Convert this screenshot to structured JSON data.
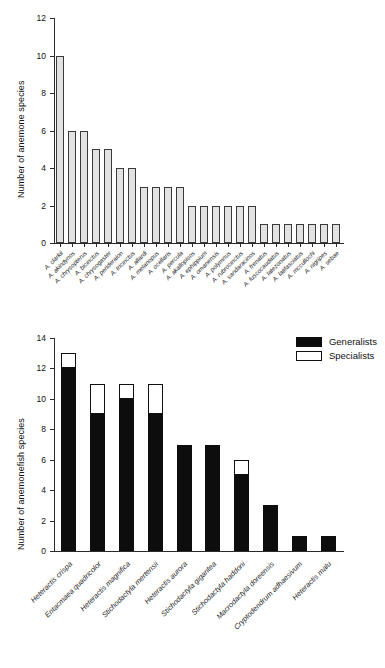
{
  "figure": {
    "panels": [
      "top",
      "bottom"
    ]
  },
  "legend": {
    "entries": [
      {
        "label": "Generalists",
        "swatch": "filled-black-rect",
        "color": "#0d0d0d"
      },
      {
        "label": "Specialists",
        "swatch": "hollow-white-rect",
        "color": "#ffffff"
      }
    ]
  },
  "chart_data": [
    {
      "type": "bar",
      "panel": "top",
      "title": "",
      "xlabel": "",
      "ylabel": "Number of anemone species",
      "ylim": [
        0,
        12
      ],
      "yticks": [
        0,
        2,
        4,
        6,
        8,
        10,
        12
      ],
      "grid": false,
      "legend_position": "none",
      "bar_style": {
        "fill": "#e2e2e2",
        "stroke": "#3a3a3a"
      },
      "categories": [
        "A. clarkii",
        "A. akindynos",
        "A. chrysopterus",
        "A. bicinctus",
        "A. chrysogaster",
        "A. perideraion",
        "A. tricinctus",
        "A. allardi",
        "A. melanopus",
        "A. ocellaris",
        "A. percula",
        "A. akallopisos",
        "A. ephippium",
        "A. omanensis",
        "A. polymnus",
        "A. rubrocinctus",
        "A. sandaracinos",
        "A. frenatus",
        "A. fuscocaudatus",
        "A. latezonatus",
        "A. latifasciatus",
        "A. mccullochi",
        "A. nigripes",
        "A. sebae"
      ],
      "values": [
        10,
        6,
        6,
        5,
        5,
        4,
        4,
        3,
        3,
        3,
        3,
        2,
        2,
        2,
        2,
        2,
        2,
        1,
        1,
        1,
        1,
        1,
        1,
        1
      ]
    },
    {
      "type": "bar",
      "panel": "bottom",
      "stacked": true,
      "title": "",
      "xlabel": "",
      "ylabel": "Number of anemonefish species",
      "ylim": [
        0,
        14
      ],
      "yticks": [
        0,
        2,
        4,
        6,
        8,
        10,
        12,
        14
      ],
      "grid": false,
      "legend_position": "top-right",
      "categories": [
        "Heteractis crispa",
        "Entacmaea quadricolor",
        "Heteractis magnifica",
        "Stichodactyla mertensii",
        "Heteractis aurora",
        "Stichodactyla gigantea",
        "Stichodactyla haddoni",
        "Macrodactyla doreensis",
        "Cryptodendrum adhaesivum",
        "Heteractis malu"
      ],
      "series": [
        {
          "name": "Generalists",
          "color": "#0d0d0d",
          "values": [
            12,
            9,
            10,
            9,
            7,
            7,
            5,
            3,
            1,
            1
          ]
        },
        {
          "name": "Specialists",
          "color": "#ffffff",
          "values": [
            1,
            2,
            1,
            2,
            0,
            0,
            1,
            0,
            0,
            0
          ]
        }
      ],
      "totals": [
        13,
        11,
        11,
        11,
        7,
        7,
        6,
        3,
        1,
        1
      ]
    }
  ]
}
